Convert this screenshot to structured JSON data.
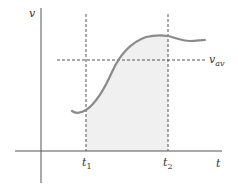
{
  "diagram": {
    "type": "velocity-time graph",
    "axes": {
      "y_label": "v",
      "x_label": "t"
    },
    "markers": {
      "t1_label": "t",
      "t1_sub": "1",
      "t2_label": "t",
      "t2_sub": "2",
      "vav_label": "v",
      "vav_sub": "av"
    },
    "colors": {
      "axis": "#555555",
      "curve": "#8a8a8a",
      "fill": "#f0f0f0",
      "dashed": "#555555",
      "text": "#333333"
    }
  }
}
